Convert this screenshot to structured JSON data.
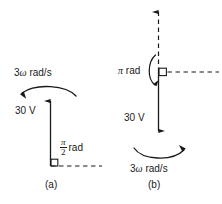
{
  "figure": {
    "type": "phasor-diagram",
    "background_color": "#ffffff",
    "stroke_color": "#1a1a1a",
    "panels": [
      {
        "id": "a",
        "caption": "(a)",
        "phasor": {
          "magnitude_label": "30 V",
          "direction": "up",
          "line_style": "solid"
        },
        "rotation": {
          "label_number": "3",
          "label_symbol": "ω",
          "label_units": "rad/s",
          "full_label": "3 ω rad/s",
          "arc_direction": "counterclockwise",
          "arc_bow": "up",
          "arrowhead_side": "left"
        },
        "phase": {
          "numerator": "π",
          "denominator": "2",
          "units": "rad",
          "full_label": "π/2 rad",
          "reference_axis_style": "dashed",
          "angle_marker": "right-angle-square"
        }
      },
      {
        "id": "b",
        "caption": "(b)",
        "phasor": {
          "magnitude_label": "30 V",
          "direction": "down",
          "line_style": "solid"
        },
        "rotation": {
          "label_number": "3",
          "label_symbol": "ω",
          "label_units": "rad/s",
          "full_label": "3 ω rad/s",
          "arc_direction": "clockwise",
          "arc_bow": "down",
          "arrowhead_side": "right"
        },
        "phase": {
          "symbol": "π",
          "units": "rad",
          "full_label": "π rad",
          "reference_axis_style": "dashed",
          "angle_marker": "right-angle-square"
        },
        "reference_vector": {
          "direction": "up",
          "line_style": "dashed"
        }
      }
    ]
  }
}
